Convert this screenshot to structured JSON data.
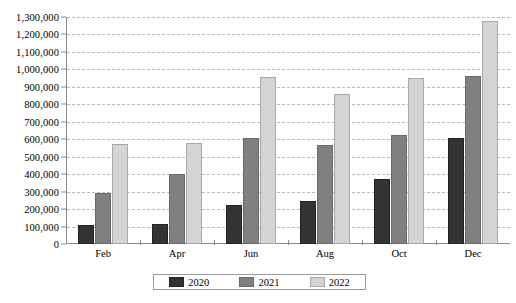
{
  "chart_data": {
    "type": "bar",
    "title": "",
    "xlabel": "",
    "ylabel": "",
    "categories": [
      "Feb",
      "Apr",
      "Jun",
      "Aug",
      "Oct",
      "Dec"
    ],
    "series": [
      {
        "name": "2020",
        "color": "#333333",
        "values": [
          110000,
          115000,
          225000,
          245000,
          375000,
          605000
        ]
      },
      {
        "name": "2021",
        "color": "#808080",
        "values": [
          290000,
          400000,
          610000,
          565000,
          625000,
          960000
        ]
      },
      {
        "name": "2022",
        "color": "#d4d4d4",
        "values": [
          570000,
          580000,
          955000,
          860000,
          950000,
          1275000
        ]
      }
    ],
    "ylim": [
      0,
      1300000
    ],
    "ytick_step": 100000,
    "ytick_labels": [
      "1,300,000",
      "1,200,000",
      "1,100,000",
      "1,000,000",
      "900,000",
      "800,000",
      "700,000",
      "600,000",
      "500,000",
      "400,000",
      "300,000",
      "200,000",
      "100,000",
      "0"
    ],
    "ytick_values": [
      1300000,
      1200000,
      1100000,
      1000000,
      900000,
      800000,
      700000,
      600000,
      500000,
      400000,
      300000,
      200000,
      100000,
      0
    ],
    "grid": true,
    "grid_color": "#b9b9b9",
    "legend_position": "bottom",
    "axis_color": "#8a8a8a",
    "background": "#ffffff"
  }
}
